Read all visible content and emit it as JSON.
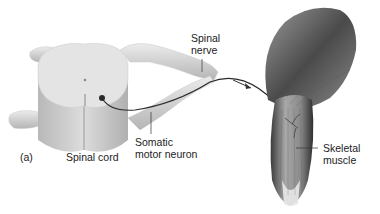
{
  "figure": {
    "panel_label": "(a)",
    "labels": {
      "spinal_nerve": [
        "Spinal",
        "nerve"
      ],
      "spinal_cord": "Spinal cord",
      "somatic_motor_neuron": [
        "Somatic",
        "motor neuron"
      ],
      "skeletal_muscle": [
        "Skeletal",
        "muscle"
      ]
    },
    "colors": {
      "background": "#ffffff",
      "cord_top": "#e4e4e4",
      "cord_side": "#c8c8c8",
      "nerve": "#d8d8d8",
      "axon": "#2a2a2a",
      "muscle_dark": "#3a3a3a",
      "muscle_light": "#bdbdbd",
      "text": "#222222"
    }
  }
}
